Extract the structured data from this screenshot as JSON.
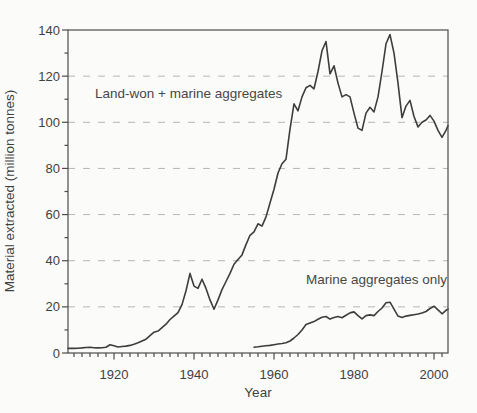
{
  "chart_data": {
    "type": "line",
    "title": "",
    "xlabel": "Year",
    "ylabel": "Material extracted (million tonnes)",
    "xlim": [
      1908.5,
      2003.5
    ],
    "ylim": [
      0,
      140
    ],
    "x_major_ticks": [
      1920,
      1940,
      1960,
      1980,
      2000
    ],
    "x_minor_tick_step": 2,
    "y_major_tick_step": 20,
    "y_minor_tick_step": 10,
    "grid": {
      "horizontal_dashed_at": [
        20,
        40,
        60,
        80,
        100,
        120
      ]
    },
    "legend_position": "none",
    "colors": {
      "line": "#3d3d3d",
      "grid": "#b6b6b6",
      "axis": "#4b4b4b",
      "text": "#3f3f3f",
      "background": "#fbfbf9"
    },
    "annotations": [
      {
        "text": "Land-won + marine aggregates",
        "near_value_x": 1916,
        "near_value_y": 113
      },
      {
        "text": "Marine aggregates only",
        "near_value_x": 1968,
        "near_value_y": 32
      }
    ],
    "series": [
      {
        "id": "land_won_plus_marine",
        "name": "Land-won + marine aggregates",
        "points": [
          [
            1908.5,
            2
          ],
          [
            1910,
            2
          ],
          [
            1911,
            2.1
          ],
          [
            1912,
            2.2
          ],
          [
            1913,
            2.4
          ],
          [
            1914,
            2.5
          ],
          [
            1915,
            2.3
          ],
          [
            1916,
            2.2
          ],
          [
            1917,
            2.3
          ],
          [
            1918,
            2.5
          ],
          [
            1919,
            3.6
          ],
          [
            1920,
            3.1
          ],
          [
            1921,
            2.6
          ],
          [
            1922,
            2.8
          ],
          [
            1923,
            3
          ],
          [
            1924,
            3.3
          ],
          [
            1925,
            3.8
          ],
          [
            1926,
            4.4
          ],
          [
            1927,
            5.2
          ],
          [
            1928,
            6
          ],
          [
            1929,
            7.5
          ],
          [
            1930,
            9
          ],
          [
            1931,
            9.5
          ],
          [
            1932,
            11
          ],
          [
            1933,
            12.5
          ],
          [
            1934,
            14.5
          ],
          [
            1935,
            16
          ],
          [
            1936,
            17.5
          ],
          [
            1937,
            21
          ],
          [
            1938,
            27
          ],
          [
            1939,
            34.5
          ],
          [
            1940,
            29
          ],
          [
            1941,
            28
          ],
          [
            1942,
            32
          ],
          [
            1943,
            28
          ],
          [
            1944,
            23
          ],
          [
            1945,
            19
          ],
          [
            1946,
            23
          ],
          [
            1947,
            27.5
          ],
          [
            1948,
            31
          ],
          [
            1949,
            34.5
          ],
          [
            1950,
            38.5
          ],
          [
            1951,
            40.5
          ],
          [
            1952,
            42.5
          ],
          [
            1953,
            47
          ],
          [
            1954,
            51
          ],
          [
            1955,
            52.5
          ],
          [
            1956,
            56
          ],
          [
            1957,
            55
          ],
          [
            1958,
            59
          ],
          [
            1959,
            65
          ],
          [
            1960,
            71
          ],
          [
            1961,
            78
          ],
          [
            1962,
            82
          ],
          [
            1963,
            84
          ],
          [
            1964,
            97
          ],
          [
            1965,
            108
          ],
          [
            1966,
            105
          ],
          [
            1967,
            111
          ],
          [
            1968,
            115
          ],
          [
            1969,
            116
          ],
          [
            1970,
            114.5
          ],
          [
            1971,
            122
          ],
          [
            1972,
            131
          ],
          [
            1973,
            135
          ],
          [
            1974,
            121
          ],
          [
            1975,
            124.5
          ],
          [
            1976,
            117
          ],
          [
            1977,
            111
          ],
          [
            1978,
            112
          ],
          [
            1979,
            111
          ],
          [
            1980,
            104
          ],
          [
            1981,
            97.5
          ],
          [
            1982,
            96.5
          ],
          [
            1983,
            104
          ],
          [
            1984,
            106.5
          ],
          [
            1985,
            104.5
          ],
          [
            1986,
            111
          ],
          [
            1987,
            122
          ],
          [
            1988,
            134
          ],
          [
            1989,
            138
          ],
          [
            1990,
            130
          ],
          [
            1991,
            117
          ],
          [
            1992,
            102
          ],
          [
            1993,
            107
          ],
          [
            1994,
            109.5
          ],
          [
            1995,
            102.5
          ],
          [
            1996,
            98
          ],
          [
            1997,
            100
          ],
          [
            1998,
            101
          ],
          [
            1999,
            103
          ],
          [
            2000,
            100.5
          ],
          [
            2001,
            96.5
          ],
          [
            2002,
            93.5
          ],
          [
            2003,
            96.5
          ],
          [
            2003.5,
            98.5
          ]
        ]
      },
      {
        "id": "marine_only",
        "name": "Marine aggregates only",
        "points": [
          [
            1955,
            2.5
          ],
          [
            1956,
            2.7
          ],
          [
            1957,
            2.9
          ],
          [
            1958,
            3.1
          ],
          [
            1959,
            3.3
          ],
          [
            1960,
            3.6
          ],
          [
            1961,
            3.9
          ],
          [
            1962,
            4.1
          ],
          [
            1963,
            4.4
          ],
          [
            1964,
            5.2
          ],
          [
            1965,
            6.5
          ],
          [
            1966,
            8
          ],
          [
            1967,
            10
          ],
          [
            1968,
            12.3
          ],
          [
            1969,
            13
          ],
          [
            1970,
            13.6
          ],
          [
            1971,
            14.6
          ],
          [
            1972,
            15.5
          ],
          [
            1973,
            15.8
          ],
          [
            1974,
            14.7
          ],
          [
            1975,
            15.4
          ],
          [
            1976,
            15.8
          ],
          [
            1977,
            15.3
          ],
          [
            1978,
            16.4
          ],
          [
            1979,
            17.4
          ],
          [
            1980,
            17.8
          ],
          [
            1981,
            16.2
          ],
          [
            1982,
            14.8
          ],
          [
            1983,
            16.2
          ],
          [
            1984,
            16.5
          ],
          [
            1985,
            16.2
          ],
          [
            1986,
            18
          ],
          [
            1987,
            19.5
          ],
          [
            1988,
            21.8
          ],
          [
            1989,
            22
          ],
          [
            1990,
            19
          ],
          [
            1991,
            16
          ],
          [
            1992,
            15.4
          ],
          [
            1993,
            16
          ],
          [
            1994,
            16.3
          ],
          [
            1995,
            16.6
          ],
          [
            1996,
            16.9
          ],
          [
            1997,
            17.4
          ],
          [
            1998,
            18
          ],
          [
            1999,
            19.3
          ],
          [
            2000,
            20.3
          ],
          [
            2001,
            18.7
          ],
          [
            2002,
            17
          ],
          [
            2003,
            18.5
          ],
          [
            2003.5,
            19
          ]
        ]
      }
    ]
  }
}
